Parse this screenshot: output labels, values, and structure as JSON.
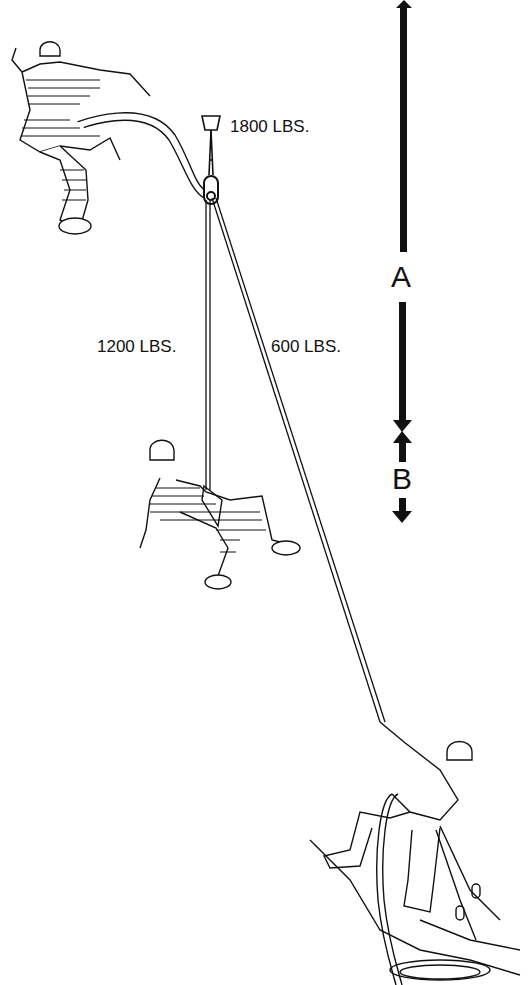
{
  "diagram": {
    "labels": {
      "anchor_load": "1800 LBS.",
      "left_strand": "1200 LBS.",
      "right_strand": "600 LBS."
    },
    "dimensions": {
      "a": "A",
      "b": "B"
    },
    "figures": [
      "lead-climber-falling",
      "second-climber-hanging",
      "belayer"
    ],
    "colors": {
      "ink": "#111111",
      "background": "#ffffff"
    }
  }
}
